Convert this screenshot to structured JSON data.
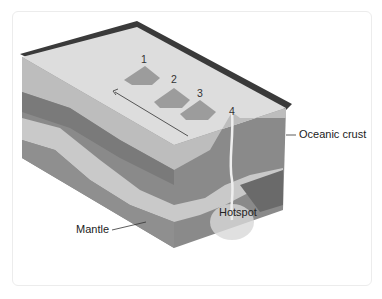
{
  "diagram": {
    "type": "block-diagram",
    "volcano_labels": [
      "1",
      "2",
      "3",
      "4"
    ],
    "labels": {
      "oceanic_crust": "Oceanic crust",
      "mantle": "Mantle",
      "hotspot": "Hotspot"
    },
    "arrow": {
      "direction": "toward older volcanoes (4 → 1)"
    },
    "colors": {
      "top_surface": "#dcdcdc",
      "back_edge": "#3a3a3a",
      "layer_light": "#c8c8c8",
      "layer_mid": "#8e8e8e",
      "layer_dark": "#6e6e6e",
      "volcano": "#9a9a9a"
    }
  }
}
